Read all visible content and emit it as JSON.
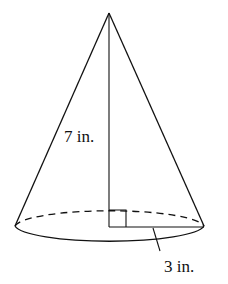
{
  "figure": {
    "shape": "right circular cone",
    "height_label": "7 in.",
    "radius_label": "3 in.",
    "right_angle_marker": true,
    "stroke_color": "#111111",
    "background": "#ffffff"
  }
}
